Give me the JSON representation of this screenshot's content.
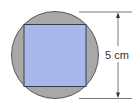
{
  "diagram": {
    "type": "circle-with-inscribed-square",
    "dimension_label": "5 cm",
    "colors": {
      "circle_fill": "#a8a8a8",
      "square_fill": "#a9b7ea",
      "outline": "#3a3a48",
      "dimension_line": "#555555",
      "background": "#ffffff"
    }
  }
}
